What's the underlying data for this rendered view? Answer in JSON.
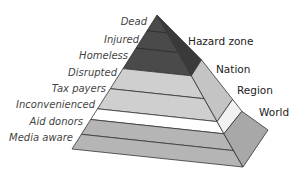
{
  "diagram": {
    "type": "layered-pyramid",
    "front_face_layers": [
      {
        "label": "Dead",
        "color": "#4a4a4a"
      },
      {
        "label": "Injured",
        "color": "#4a4a4a"
      },
      {
        "label": "Homeless",
        "color": "#4a4a4a"
      },
      {
        "label": "Disrupted",
        "color": "#cfcfcf"
      },
      {
        "label": "Tax payers",
        "color": "#cfcfcf"
      },
      {
        "label": "Inconvenienced",
        "color": "#ffffff"
      },
      {
        "label": "Aid donors",
        "color": "#b5b5b5"
      },
      {
        "label": "Media aware",
        "color": "#b5b5b5"
      }
    ],
    "side_face_zones": [
      {
        "label": "Hazard zone",
        "color": "#3a3a3a"
      },
      {
        "label": "Nation",
        "color": "#c4c4c4"
      },
      {
        "label": "Region",
        "color": "#f2f2f2"
      },
      {
        "label": "World",
        "color": "#a8a8a8"
      }
    ],
    "colors": {
      "outline": "#333333",
      "dark": "#4a4a4a",
      "light": "#cfcfcf",
      "white": "#ffffff",
      "mid": "#b5b5b5"
    }
  }
}
